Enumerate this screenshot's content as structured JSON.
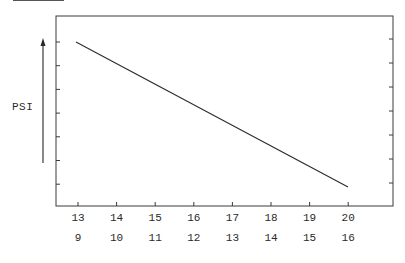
{
  "chart_data": {
    "type": "line",
    "title": "",
    "xlabel": "",
    "ylabel": "PSI",
    "ylabel_arrow": "up",
    "x_tick_labels_row1": [
      "13",
      "14",
      "15",
      "16",
      "17",
      "18",
      "19",
      "20"
    ],
    "x_tick_labels_row2": [
      "9",
      "10",
      "11",
      "12",
      "13",
      "14",
      "15",
      "16"
    ],
    "y_tick_count": 7,
    "y_tick_labels": [],
    "grid": false,
    "legend": null,
    "series": [
      {
        "name": "PSI",
        "x": [
          13,
          20
        ],
        "x_secondary": [
          9,
          16
        ],
        "values": [
          0.85,
          0.1
        ],
        "note": "Straight line decreasing from high PSI at x=13 to low PSI at x=20 (relative scale, no numeric y labels)"
      }
    ],
    "xlim": [
      12.5,
      21.1
    ],
    "ylim": [
      0,
      1
    ]
  },
  "colors": {
    "line": "#2a2a2a",
    "axis": "#3a3a3a",
    "background": "#ffffff"
  }
}
